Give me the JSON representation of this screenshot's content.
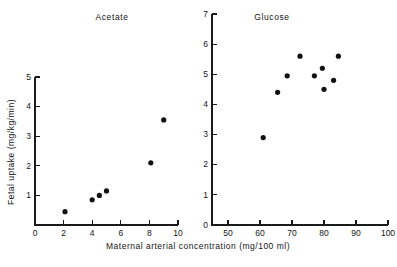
{
  "figure": {
    "axis_title_x": "Maternal arterial concentration (mg/100 ml)",
    "axis_title_y": "Fetal uptake (mg/kg/min)",
    "marker_color": "#111111",
    "axis_color": "#1a1a1a",
    "background": "#ffffff"
  },
  "chart_data": [
    {
      "type": "scatter",
      "title": "Acetate",
      "xlabel": "Maternal arterial concentration (mg/100 ml)",
      "ylabel": "Fetal uptake (mg/kg/min)",
      "xlim": [
        0,
        10
      ],
      "ylim": [
        0,
        5
      ],
      "xticks": [
        0,
        2,
        4,
        6,
        8,
        10
      ],
      "yticks": [
        1,
        2,
        3,
        4,
        5
      ],
      "xticklabels": [
        "0",
        "2",
        "4",
        "6",
        "8",
        "10"
      ],
      "yticklabels": [
        "1",
        "2",
        "3",
        "4",
        "5"
      ],
      "grid": false,
      "legend": "none",
      "points": [
        {
          "x": 2.1,
          "y": 0.45
        },
        {
          "x": 4.0,
          "y": 0.85
        },
        {
          "x": 4.5,
          "y": 1.0
        },
        {
          "x": 5.0,
          "y": 1.15
        },
        {
          "x": 8.1,
          "y": 2.1
        },
        {
          "x": 9.0,
          "y": 3.55
        }
      ]
    },
    {
      "type": "scatter",
      "title": "Glucose",
      "xlabel": "Maternal arterial concentration (mg/100 ml)",
      "ylabel": "Fetal uptake (mg/kg/min)",
      "xlim": [
        45,
        100
      ],
      "ylim": [
        0,
        7
      ],
      "xticks": [
        50,
        60,
        70,
        80,
        90,
        100
      ],
      "yticks": [
        0,
        1,
        2,
        3,
        4,
        5,
        6,
        7
      ],
      "xticklabels": [
        "50",
        "60",
        "70",
        "80",
        "90",
        "100"
      ],
      "yticklabels": [
        "0",
        "1",
        "2",
        "3",
        "4",
        "5",
        "6",
        "7"
      ],
      "grid": false,
      "legend": "none",
      "points": [
        {
          "x": 61.0,
          "y": 2.9
        },
        {
          "x": 65.5,
          "y": 4.4
        },
        {
          "x": 68.5,
          "y": 4.95
        },
        {
          "x": 72.5,
          "y": 5.6
        },
        {
          "x": 77.0,
          "y": 4.95
        },
        {
          "x": 79.5,
          "y": 5.2
        },
        {
          "x": 80.0,
          "y": 4.5
        },
        {
          "x": 83.0,
          "y": 4.8
        },
        {
          "x": 84.5,
          "y": 5.6
        }
      ]
    }
  ]
}
